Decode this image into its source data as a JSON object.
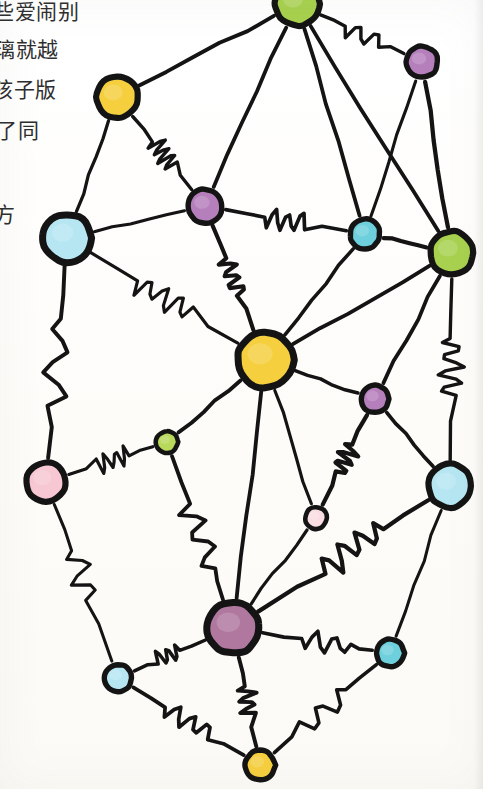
{
  "document": {
    "title": "Hand-drawn node network sketch",
    "text_lines": [
      "些爱闹别",
      "璃就越",
      "孩子版",
      "了同",
      "方"
    ]
  },
  "palette": {
    "ink": "#141414",
    "paper": "#fdfdfb",
    "yellow": "#f5cf3e",
    "green": "#a7d14e",
    "purple": "#b57fbc",
    "mauve": "#b0789f",
    "light_blue": "#b6e6f2",
    "teal": "#6ed0dc",
    "pink": "#f7c8d3",
    "pale_pink": "#f9dde2",
    "lime": "#b9d95b"
  },
  "chart_data": {
    "type": "scatter",
    "xlabel": "",
    "ylabel": "",
    "xlim": [
      0,
      483
    ],
    "ylim": [
      0,
      789
    ],
    "grid": false,
    "legend": "none",
    "nodes": [
      {
        "id": "n1",
        "label": "top-green",
        "x": 297,
        "y": 4,
        "r": 22,
        "color": "#a7d14e",
        "size": "large"
      },
      {
        "id": "n2",
        "label": "top-right-purple",
        "x": 422,
        "y": 62,
        "r": 16,
        "color": "#b57fbc",
        "size": "small"
      },
      {
        "id": "n3",
        "label": "upper-left-yellow",
        "x": 117,
        "y": 97,
        "r": 21,
        "color": "#f5cf3e",
        "size": "large"
      },
      {
        "id": "n4",
        "label": "mid-upper-purple",
        "x": 205,
        "y": 206,
        "r": 17,
        "color": "#b57fbc",
        "size": "small"
      },
      {
        "id": "n5",
        "label": "left-light-blue",
        "x": 67,
        "y": 238,
        "r": 24,
        "color": "#b6e6f2",
        "size": "large"
      },
      {
        "id": "n6",
        "label": "mid-upper-teal",
        "x": 365,
        "y": 234,
        "r": 15,
        "color": "#6ed0dc",
        "size": "small"
      },
      {
        "id": "n7",
        "label": "right-green",
        "x": 452,
        "y": 253,
        "r": 22,
        "color": "#a7d14e",
        "size": "large"
      },
      {
        "id": "n8",
        "label": "center-hub-yellow",
        "x": 265,
        "y": 360,
        "r": 28,
        "color": "#f5cf3e",
        "size": "hub"
      },
      {
        "id": "n9",
        "label": "right-small-purple",
        "x": 375,
        "y": 399,
        "r": 14,
        "color": "#b57fbc",
        "size": "small"
      },
      {
        "id": "n10",
        "label": "center-small-lime",
        "x": 167,
        "y": 442,
        "r": 11,
        "color": "#b9d95b",
        "size": "tiny"
      },
      {
        "id": "n11",
        "label": "left-pink",
        "x": 46,
        "y": 482,
        "r": 20,
        "color": "#f7c8d3",
        "size": "large"
      },
      {
        "id": "n12",
        "label": "right-light-blue",
        "x": 450,
        "y": 486,
        "r": 22,
        "color": "#b6e6f2",
        "size": "large"
      },
      {
        "id": "n13",
        "label": "center-tiny-pink",
        "x": 316,
        "y": 518,
        "r": 11,
        "color": "#f9dde2",
        "size": "tiny"
      },
      {
        "id": "n14",
        "label": "bottom-hub-mauve",
        "x": 233,
        "y": 628,
        "r": 26,
        "color": "#b0789f",
        "size": "hub"
      },
      {
        "id": "n15",
        "label": "bottom-right-teal",
        "x": 390,
        "y": 653,
        "r": 14,
        "color": "#6ed0dc",
        "size": "small"
      },
      {
        "id": "n16",
        "label": "bottom-left-blue",
        "x": 118,
        "y": 678,
        "r": 14,
        "color": "#b6e6f2",
        "size": "small"
      },
      {
        "id": "n17",
        "label": "bottom-yellow",
        "x": 260,
        "y": 765,
        "r": 15,
        "color": "#f5cf3e",
        "size": "small"
      }
    ],
    "edges": [
      {
        "source": "n1",
        "target": "n3",
        "style": "straight"
      },
      {
        "source": "n1",
        "target": "n2",
        "style": "wiggly"
      },
      {
        "source": "n1",
        "target": "n4",
        "style": "straight"
      },
      {
        "source": "n1",
        "target": "n6",
        "style": "straight"
      },
      {
        "source": "n1",
        "target": "n7",
        "style": "straight"
      },
      {
        "source": "n2",
        "target": "n6",
        "style": "straight"
      },
      {
        "source": "n2",
        "target": "n7",
        "style": "straight"
      },
      {
        "source": "n3",
        "target": "n4",
        "style": "wiggly"
      },
      {
        "source": "n3",
        "target": "n5",
        "style": "straight"
      },
      {
        "source": "n4",
        "target": "n5",
        "style": "straight"
      },
      {
        "source": "n4",
        "target": "n6",
        "style": "wiggly"
      },
      {
        "source": "n4",
        "target": "n8",
        "style": "wiggly"
      },
      {
        "source": "n5",
        "target": "n8",
        "style": "wiggly"
      },
      {
        "source": "n5",
        "target": "n11",
        "style": "wiggly"
      },
      {
        "source": "n6",
        "target": "n7",
        "style": "straight"
      },
      {
        "source": "n6",
        "target": "n8",
        "style": "straight"
      },
      {
        "source": "n7",
        "target": "n8",
        "style": "straight"
      },
      {
        "source": "n7",
        "target": "n9",
        "style": "straight"
      },
      {
        "source": "n7",
        "target": "n12",
        "style": "wiggly"
      },
      {
        "source": "n8",
        "target": "n9",
        "style": "straight"
      },
      {
        "source": "n8",
        "target": "n10",
        "style": "straight"
      },
      {
        "source": "n8",
        "target": "n13",
        "style": "straight"
      },
      {
        "source": "n8",
        "target": "n14",
        "style": "straight"
      },
      {
        "source": "n9",
        "target": "n13",
        "style": "wiggly"
      },
      {
        "source": "n9",
        "target": "n12",
        "style": "straight"
      },
      {
        "source": "n10",
        "target": "n11",
        "style": "wiggly"
      },
      {
        "source": "n10",
        "target": "n14",
        "style": "wiggly"
      },
      {
        "source": "n11",
        "target": "n16",
        "style": "wiggly"
      },
      {
        "source": "n12",
        "target": "n14",
        "style": "wiggly"
      },
      {
        "source": "n12",
        "target": "n15",
        "style": "straight"
      },
      {
        "source": "n13",
        "target": "n14",
        "style": "straight"
      },
      {
        "source": "n14",
        "target": "n15",
        "style": "wiggly"
      },
      {
        "source": "n14",
        "target": "n16",
        "style": "wiggly"
      },
      {
        "source": "n14",
        "target": "n17",
        "style": "wiggly"
      },
      {
        "source": "n16",
        "target": "n17",
        "style": "wiggly"
      },
      {
        "source": "n15",
        "target": "n17",
        "style": "wiggly"
      }
    ]
  }
}
